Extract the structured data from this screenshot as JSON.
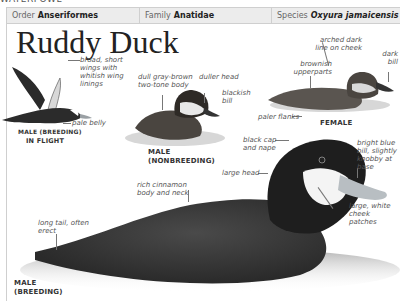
{
  "section": "WATERFOWL",
  "header": {
    "order_label": "Order",
    "order_value": "Anseriformes",
    "family_label": "Family",
    "family_value": "Anatidae",
    "species_label": "Species",
    "species_value": "Oxyura jamaicensis"
  },
  "title": "Ruddy Duck",
  "figures": {
    "flight": {
      "caption_line1": "MALE (BREEDING)",
      "caption_line2": "IN FLIGHT",
      "notes": [
        "broad, short wings with whitish wing linings",
        "pale belly"
      ]
    },
    "nonbreeding": {
      "caption_line1": "MALE",
      "caption_line2": "(NONBREEDING)",
      "notes": [
        "dull gray-brown two-tone body",
        "duller head",
        "blackish bill"
      ]
    },
    "female": {
      "caption": "FEMALE",
      "notes": [
        "arched dark line on cheek",
        "dark bill",
        "brownish upperparts",
        "paler flanks"
      ]
    },
    "breeding": {
      "caption_line1": "MALE",
      "caption_line2": "(BREEDING)",
      "notes": [
        "black cap and nape",
        "bright blue bill, slightly knobby at base",
        "large head",
        "large, white cheek patches",
        "rich cinnamon body and neck",
        "long tail, often erect"
      ]
    }
  },
  "colors": {
    "header_bg": "#ececec",
    "header_border": "#cfcfcf",
    "title": "#222222"
  }
}
